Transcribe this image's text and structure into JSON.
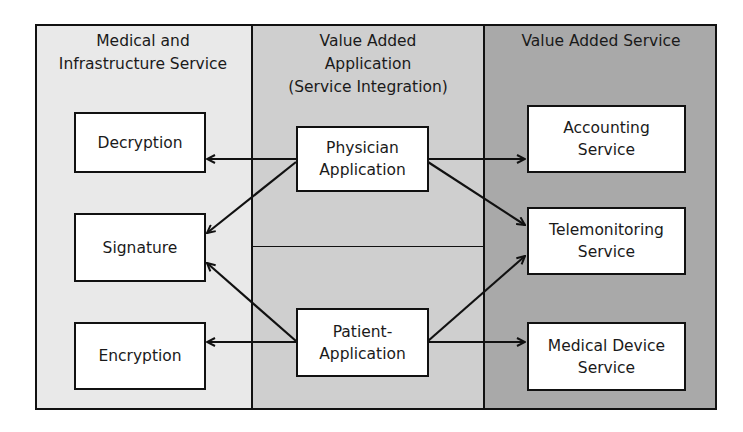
{
  "columns": [
    {
      "title_line1": "Medical and",
      "title_line2": "Infrastructure Service",
      "fill": "#e9e9e9"
    },
    {
      "title_line1": "Value Added",
      "title_line2": "Application",
      "title_line3": "(Service Integration)",
      "fill": "#cfcfcf"
    },
    {
      "title_line1": "Value Added Service",
      "fill": "#a9a9a9"
    }
  ],
  "nodes": {
    "decryption": {
      "line1": "Decryption"
    },
    "signature": {
      "line1": "Signature"
    },
    "encryption": {
      "line1": "Encryption"
    },
    "physician": {
      "line1": "Physician",
      "line2": "Application"
    },
    "patient": {
      "line1": "Patient-",
      "line2": "Application"
    },
    "accounting": {
      "line1": "Accounting",
      "line2": "Service"
    },
    "telemonitoring": {
      "line1": "Telemonitoring",
      "line2": "Service"
    },
    "medical_device": {
      "line1": "Medical Device",
      "line2": "Service"
    }
  },
  "edges": [
    {
      "from": "Physician Application",
      "to": "Decryption"
    },
    {
      "from": "Physician Application",
      "to": "Signature"
    },
    {
      "from": "Physician Application",
      "to": "Accounting Service"
    },
    {
      "from": "Physician Application",
      "to": "Telemonitoring Service"
    },
    {
      "from": "Patient-Application",
      "to": "Signature"
    },
    {
      "from": "Patient-Application",
      "to": "Encryption"
    },
    {
      "from": "Patient-Application",
      "to": "Telemonitoring Service"
    },
    {
      "from": "Patient-Application",
      "to": "Medical Device Service"
    }
  ]
}
